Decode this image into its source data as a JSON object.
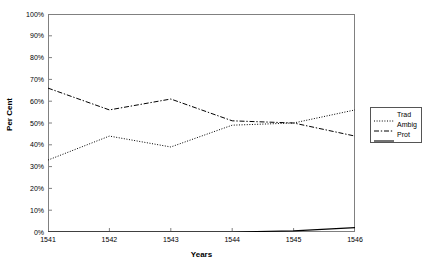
{
  "chart_data": {
    "type": "line",
    "title": "",
    "xlabel": "Years",
    "ylabel": "Per Cent",
    "categories": [
      "1541",
      "1542",
      "1543",
      "1544",
      "1545",
      "1546"
    ],
    "x": [
      1541,
      1542,
      1543,
      1544,
      1545,
      1546
    ],
    "xlim": [
      1541,
      1546
    ],
    "ylim": [
      0,
      100
    ],
    "ytick_labels": [
      "100%",
      "90%",
      "80%",
      "70%",
      "60%",
      "50%",
      "40%",
      "30%",
      "20%",
      "10%",
      "0%"
    ],
    "ytick_values": [
      100,
      90,
      80,
      70,
      60,
      50,
      40,
      30,
      20,
      10,
      0
    ],
    "grid": false,
    "legend_position": "right-outside",
    "series": [
      {
        "name": "Trad",
        "style": "dotted",
        "color": "#000000",
        "values": [
          33,
          44,
          39,
          49,
          50,
          56
        ]
      },
      {
        "name": "Ambig",
        "style": "dash-dot",
        "color": "#000000",
        "values": [
          66,
          56,
          61,
          51,
          50,
          44
        ]
      },
      {
        "name": "Prot",
        "style": "solid",
        "color": "#000000",
        "values": [
          0,
          0,
          0,
          0,
          0.5,
          2
        ]
      }
    ]
  },
  "legend": {
    "items": [
      {
        "label": "Trad",
        "style": "dotted"
      },
      {
        "label": "Ambig",
        "style": "dash-dot"
      },
      {
        "label": "Prot",
        "style": "solid"
      }
    ]
  },
  "colors": {
    "axis": "#808080",
    "series": "#000000",
    "legend_border": "#555555",
    "background": "#ffffff"
  }
}
